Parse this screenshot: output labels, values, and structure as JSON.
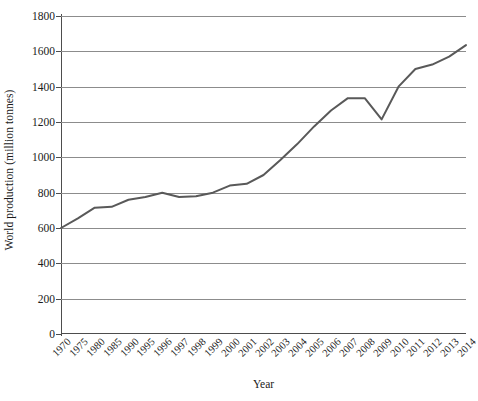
{
  "chart_data": {
    "type": "line",
    "title": "",
    "xlabel": "Year",
    "ylabel": "World production (million tonnes)",
    "categories": [
      "1970",
      "1975",
      "1980",
      "1985",
      "1990",
      "1995",
      "1996",
      "1997",
      "1998",
      "1999",
      "2000",
      "2001",
      "2002",
      "2003",
      "2004",
      "2005",
      "2006",
      "2007",
      "2008",
      "2009",
      "2010",
      "2011",
      "2012",
      "2013",
      "2014"
    ],
    "values": [
      600,
      655,
      715,
      720,
      760,
      775,
      800,
      775,
      780,
      800,
      840,
      850,
      900,
      985,
      1075,
      1175,
      1265,
      1335,
      1335,
      1215,
      1400,
      1500,
      1525,
      1570,
      1635
    ],
    "series": [
      {
        "name": "World production",
        "values": [
          600,
          655,
          715,
          720,
          760,
          775,
          800,
          775,
          780,
          800,
          840,
          850,
          900,
          985,
          1075,
          1175,
          1265,
          1335,
          1335,
          1215,
          1400,
          1500,
          1525,
          1570,
          1635
        ]
      }
    ],
    "ylim": [
      0,
      1800
    ],
    "y_ticks": [
      0,
      200,
      400,
      600,
      800,
      1000,
      1200,
      1400,
      1600,
      1800
    ],
    "y_tick_labels": [
      "0",
      "200",
      "400",
      "600",
      "800",
      "1000",
      "1200",
      "1400",
      "1600",
      "1800"
    ],
    "grid": "horizontal",
    "legend": "none",
    "line_color": "#595959",
    "grid_color": "#8c8c8c",
    "axis_color": "#4d4d4d",
    "x_tick_rotation": -45
  }
}
